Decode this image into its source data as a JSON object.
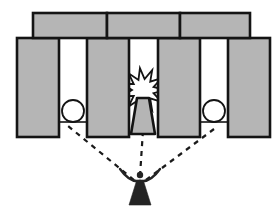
{
  "diagram": {
    "title": "Stonehenge solstice alignment diagram",
    "canvas": {
      "width": 279,
      "height": 211
    },
    "colors": {
      "background": "#ffffff",
      "stone_fill": "#b5b5b5",
      "stone_outline": "#141414",
      "disc_fill": "#ffffff",
      "disc_outline": "#141414",
      "burst_fill": "#ffffff",
      "burst_outline": "#141414",
      "figure_fill": "#242424",
      "sightline_color": "#1a1a1a",
      "ground_color": "#141414"
    },
    "stroke": {
      "stone_outline_width": 2.6,
      "disc_outline_width": 1.8,
      "burst_outline_width": 1.8,
      "ground_width": 1.6,
      "sightline_width": 2.2,
      "sightline_dash": "5,5"
    }
  },
  "lintels": {
    "label": "lintel stones",
    "count": 3,
    "top": 13,
    "bottom": 38,
    "items": [
      {
        "name": "lintel-left",
        "x": 33,
        "y": 13,
        "width": 74,
        "height": 25
      },
      {
        "name": "lintel-center",
        "x": 107,
        "y": 13,
        "width": 73,
        "height": 25
      },
      {
        "name": "lintel-right",
        "x": 180,
        "y": 13,
        "width": 70,
        "height": 25
      }
    ]
  },
  "uprights": {
    "label": "upright standing stones",
    "count": 6,
    "top": 38,
    "bottom": 137,
    "items": [
      {
        "name": "upright-1",
        "x": 17,
        "y": 38,
        "width": 42,
        "height": 99
      },
      {
        "name": "upright-2",
        "x": 87,
        "y": 38,
        "width": 42,
        "height": 99
      },
      {
        "name": "upright-3",
        "x": 87,
        "y": 38,
        "width": 0,
        "height": 0
      },
      {
        "name": "upright-4",
        "x": 158,
        "y": 38,
        "width": 42,
        "height": 99
      },
      {
        "name": "upright-5",
        "x": 228,
        "y": 38,
        "width": 42,
        "height": 99
      },
      {
        "name": "upright-6",
        "x": 0,
        "y": 0,
        "width": 0,
        "height": 0
      }
    ],
    "drawn": [
      {
        "name": "upright-1",
        "x": 17,
        "y": 38,
        "width": 42,
        "height": 99
      },
      {
        "name": "upright-2",
        "x": 87,
        "y": 38,
        "width": 42,
        "height": 99
      },
      {
        "name": "upright-3",
        "x": 158,
        "y": 38,
        "width": 42,
        "height": 99
      },
      {
        "name": "upright-4",
        "x": 228,
        "y": 38,
        "width": 42,
        "height": 99
      }
    ]
  },
  "gaps": {
    "label": "openings between the stones",
    "items": [
      {
        "name": "gap-left",
        "x": 59,
        "width": 28,
        "contains": "celestial-disc"
      },
      {
        "name": "gap-center",
        "x": 129,
        "width": 29,
        "contains": "radiant-burst"
      },
      {
        "name": "gap-right",
        "x": 200,
        "width": 28,
        "contains": "celestial-disc"
      }
    ]
  },
  "discs": {
    "label": "celestial disc seen through opening",
    "count": 2,
    "radius": 11,
    "items": [
      {
        "name": "disc-left",
        "cx": 73,
        "cy": 111
      },
      {
        "name": "disc-right",
        "cx": 214,
        "cy": 111
      }
    ]
  },
  "ground_lines": {
    "label": "horizon line inside openings",
    "y": 122,
    "items": [
      {
        "name": "ground-left",
        "x1": 59,
        "x2": 87,
        "y": 122
      },
      {
        "name": "ground-right",
        "x1": 200,
        "x2": 228,
        "y": 122
      }
    ]
  },
  "burst": {
    "label": "radiant burst",
    "name": "radiant-burst",
    "cx": 143,
    "cy": 90,
    "outer_radius": 22,
    "inner_radius": 11,
    "points": 11,
    "rotation_deg": -8
  },
  "altar": {
    "label": "altar stone",
    "name": "altar-stone",
    "top_y": 98,
    "bottom_y": 134,
    "top_left_x": 137,
    "top_right_x": 149,
    "bottom_left_x": 131,
    "bottom_right_x": 155,
    "corner_radius": 3
  },
  "observer": {
    "label": "observer figure with raised arms",
    "name": "observer-figure",
    "center_x": 140,
    "head_cx": 140,
    "head_cy": 175,
    "head_r": 3.2,
    "shoulder_y": 181,
    "arm_span_left_x": 120,
    "arm_span_right_x": 160,
    "arm_tip_y": 169,
    "body_top_y": 180,
    "body_bottom_y": 205,
    "robe_half_width": 11
  },
  "sightlines": {
    "label": "dashed lines of sight from observer to each opening",
    "count": 3,
    "origin": {
      "x": 140,
      "y": 180
    },
    "items": [
      {
        "name": "sightline-left",
        "x1": 134,
        "y1": 180,
        "x2": 68,
        "y2": 126,
        "target": "disc-left"
      },
      {
        "name": "sightline-center",
        "x1": 140,
        "y1": 176,
        "x2": 143,
        "y2": 130,
        "target": "altar-stone"
      },
      {
        "name": "sightline-right",
        "x1": 146,
        "y1": 180,
        "x2": 218,
        "y2": 126,
        "target": "disc-right"
      }
    ]
  }
}
